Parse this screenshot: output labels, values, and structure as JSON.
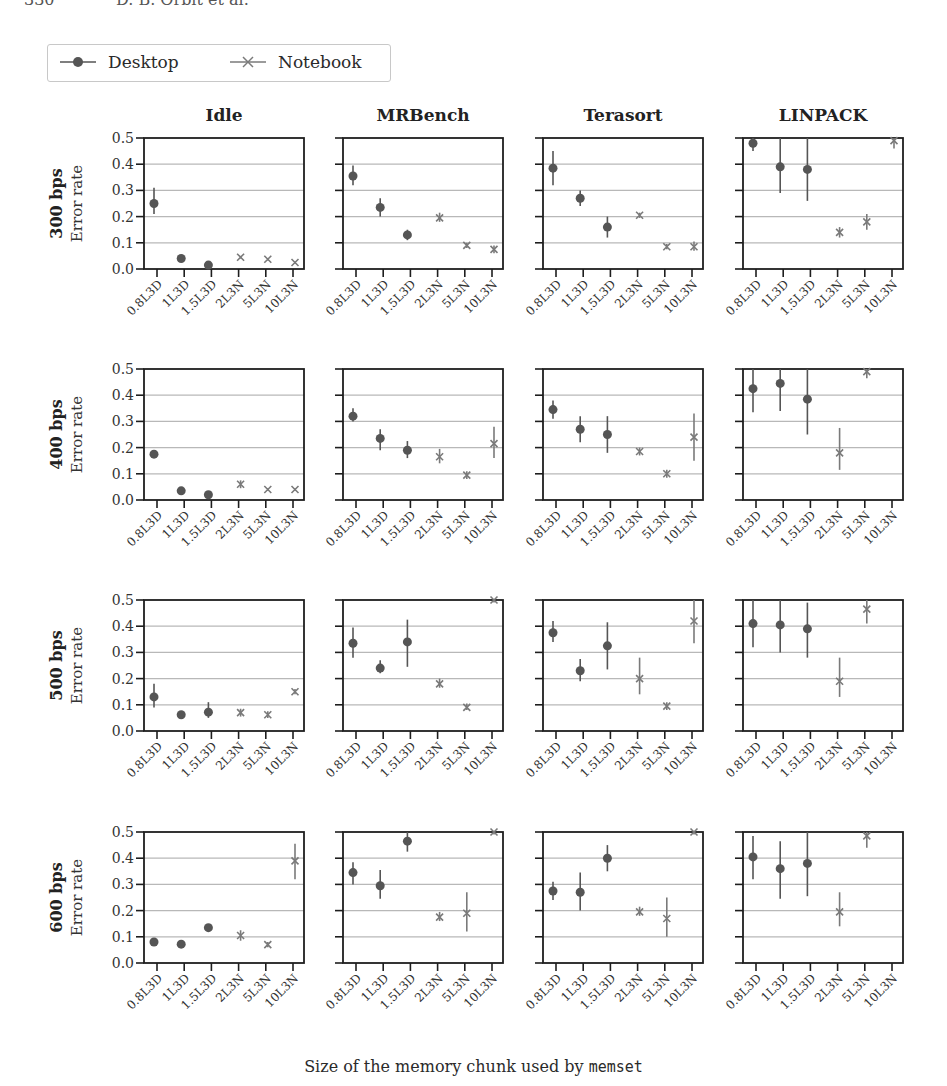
{
  "page_header": {
    "page_number": "330",
    "running_title": "D. B. Orbit et al."
  },
  "legend": {
    "items": [
      {
        "label": "Desktop",
        "marker": "circle",
        "color": "#555555"
      },
      {
        "label": "Notebook",
        "marker": "x",
        "color": "#7a7a7a"
      }
    ]
  },
  "footer": {
    "xlabel_prefix": "Size of the memory chunk used by",
    "xlabel_code": "memset"
  },
  "chart_data": {
    "type": "scatter",
    "title": "",
    "xlabel": "Size of the memory chunk used by memset",
    "ylabel": "Error rate",
    "ylim": [
      0.0,
      0.5
    ],
    "yticks": [
      "0.0",
      "0.1",
      "0.2",
      "0.3",
      "0.4",
      "0.5"
    ],
    "grid": "horizontal",
    "legend_position": "top-left",
    "categories": [
      "0.8L3D",
      "1L3D",
      "1.5L3D",
      "2L3N",
      "5L3N",
      "10L3N"
    ],
    "category_series": [
      "Desktop",
      "Desktop",
      "Desktop",
      "Notebook",
      "Notebook",
      "Notebook"
    ],
    "columns": [
      "Idle",
      "MRBench",
      "Terasort",
      "LINPACK"
    ],
    "rows": [
      "300 bps",
      "400 bps",
      "500 bps",
      "600 bps"
    ],
    "panels": [
      {
        "row": "300 bps",
        "col": "Idle",
        "values": [
          0.25,
          0.04,
          0.015,
          0.045,
          0.037,
          0.025
        ],
        "err_low": [
          0.21,
          0.035,
          0.01,
          0.04,
          0.032,
          0.02
        ],
        "err_high": [
          0.31,
          0.045,
          0.02,
          0.05,
          0.042,
          0.03
        ]
      },
      {
        "row": "300 bps",
        "col": "MRBench",
        "values": [
          0.355,
          0.235,
          0.13,
          0.195,
          0.09,
          0.075
        ],
        "err_low": [
          0.32,
          0.2,
          0.11,
          0.18,
          0.08,
          0.06
        ],
        "err_high": [
          0.395,
          0.27,
          0.15,
          0.215,
          0.1,
          0.09
        ]
      },
      {
        "row": "300 bps",
        "col": "Terasort",
        "values": [
          0.385,
          0.27,
          0.16,
          0.205,
          0.085,
          0.085
        ],
        "err_low": [
          0.32,
          0.24,
          0.12,
          0.195,
          0.075,
          0.07
        ],
        "err_high": [
          0.45,
          0.3,
          0.2,
          0.215,
          0.095,
          0.105
        ]
      },
      {
        "row": "300 bps",
        "col": "LINPACK",
        "values": [
          0.48,
          0.39,
          0.38,
          0.14,
          0.18,
          0.49
        ],
        "err_low": [
          0.45,
          0.29,
          0.26,
          0.12,
          0.15,
          0.46
        ],
        "err_high": [
          0.5,
          0.5,
          0.5,
          0.16,
          0.21,
          0.5
        ]
      },
      {
        "row": "400 bps",
        "col": "Idle",
        "values": [
          0.175,
          0.035,
          0.02,
          0.06,
          0.04,
          0.04
        ],
        "err_low": [
          0.165,
          0.03,
          0.015,
          0.045,
          0.035,
          0.035
        ],
        "err_high": [
          0.185,
          0.04,
          0.025,
          0.075,
          0.045,
          0.045
        ]
      },
      {
        "row": "400 bps",
        "col": "MRBench",
        "values": [
          0.32,
          0.235,
          0.19,
          0.165,
          0.095,
          0.215
        ],
        "err_low": [
          0.3,
          0.19,
          0.16,
          0.14,
          0.08,
          0.16
        ],
        "err_high": [
          0.35,
          0.27,
          0.225,
          0.195,
          0.11,
          0.28
        ]
      },
      {
        "row": "400 bps",
        "col": "Terasort",
        "values": [
          0.345,
          0.27,
          0.25,
          0.185,
          0.1,
          0.24
        ],
        "err_low": [
          0.31,
          0.22,
          0.18,
          0.17,
          0.085,
          0.15
        ],
        "err_high": [
          0.38,
          0.32,
          0.32,
          0.2,
          0.115,
          0.33
        ]
      },
      {
        "row": "400 bps",
        "col": "LINPACK",
        "values": [
          0.425,
          0.445,
          0.385,
          0.18,
          0.49,
          null
        ],
        "err_low": [
          0.335,
          0.34,
          0.25,
          0.115,
          0.465,
          null
        ],
        "err_high": [
          0.5,
          0.5,
          0.5,
          0.275,
          0.5,
          null
        ]
      },
      {
        "row": "500 bps",
        "col": "Idle",
        "values": [
          0.13,
          0.062,
          0.072,
          0.07,
          0.062,
          0.15
        ],
        "err_low": [
          0.09,
          0.05,
          0.05,
          0.055,
          0.05,
          0.14
        ],
        "err_high": [
          0.18,
          0.075,
          0.11,
          0.085,
          0.075,
          0.16
        ]
      },
      {
        "row": "500 bps",
        "col": "MRBench",
        "values": [
          0.335,
          0.24,
          0.34,
          0.18,
          0.09,
          0.5
        ],
        "err_low": [
          0.28,
          0.22,
          0.245,
          0.165,
          0.08,
          0.49
        ],
        "err_high": [
          0.395,
          0.27,
          0.425,
          0.2,
          0.105,
          0.5
        ]
      },
      {
        "row": "500 bps",
        "col": "Terasort",
        "values": [
          0.375,
          0.23,
          0.325,
          0.2,
          0.095,
          0.42
        ],
        "err_low": [
          0.34,
          0.19,
          0.235,
          0.14,
          0.08,
          0.335
        ],
        "err_high": [
          0.42,
          0.275,
          0.415,
          0.28,
          0.11,
          0.5
        ]
      },
      {
        "row": "500 bps",
        "col": "LINPACK",
        "values": [
          0.41,
          0.405,
          0.39,
          0.19,
          0.465,
          null
        ],
        "err_low": [
          0.32,
          0.3,
          0.28,
          0.13,
          0.41,
          null
        ],
        "err_high": [
          0.5,
          0.5,
          0.49,
          0.28,
          0.5,
          null
        ]
      },
      {
        "row": "600 bps",
        "col": "Idle",
        "values": [
          0.08,
          0.072,
          0.135,
          0.105,
          0.07,
          0.39
        ],
        "err_low": [
          0.07,
          0.065,
          0.125,
          0.085,
          0.06,
          0.32
        ],
        "err_high": [
          0.095,
          0.08,
          0.145,
          0.125,
          0.08,
          0.455
        ]
      },
      {
        "row": "600 bps",
        "col": "MRBench",
        "values": [
          0.345,
          0.295,
          0.465,
          0.175,
          0.19,
          0.5
        ],
        "err_low": [
          0.3,
          0.245,
          0.425,
          0.16,
          0.12,
          0.49
        ],
        "err_high": [
          0.385,
          0.355,
          0.5,
          0.195,
          0.27,
          0.5
        ]
      },
      {
        "row": "600 bps",
        "col": "Terasort",
        "values": [
          0.275,
          0.27,
          0.4,
          0.195,
          0.17,
          0.5
        ],
        "err_low": [
          0.24,
          0.2,
          0.35,
          0.18,
          0.1,
          0.49
        ],
        "err_high": [
          0.31,
          0.345,
          0.45,
          0.215,
          0.25,
          0.5
        ]
      },
      {
        "row": "600 bps",
        "col": "LINPACK",
        "values": [
          0.405,
          0.36,
          0.38,
          0.195,
          0.485,
          null
        ],
        "err_low": [
          0.32,
          0.245,
          0.255,
          0.14,
          0.44,
          null
        ],
        "err_high": [
          0.485,
          0.465,
          0.5,
          0.27,
          0.5,
          null
        ]
      }
    ]
  }
}
